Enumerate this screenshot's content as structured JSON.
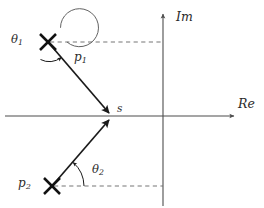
{
  "figure": {
    "background_color": "#ffffff",
    "axis_color": "#4d4d4d",
    "vector_color": "#1a1a1a",
    "dashed_color": "#6e6e6e",
    "arc_color": "#5a5a5a",
    "label_color": "#2b2b2b"
  },
  "axes": {
    "real": {
      "label": "Re",
      "label_x": 238,
      "label_y": 98,
      "x_start": 5,
      "x_end": 237,
      "y": 116
    },
    "imag": {
      "label": "Im",
      "label_x": 176,
      "label_y": 11,
      "x": 163,
      "y_top": 11,
      "y_bottom": 206
    },
    "origin": {
      "x": 163,
      "y": 116
    }
  },
  "poles": [
    {
      "name": "pole-p1",
      "label": "p",
      "subscript": "1",
      "marker": "x",
      "x": 48,
      "y": 42,
      "label_x": 74,
      "label_y": 51
    },
    {
      "name": "pole-p2",
      "label": "p",
      "subscript": "2",
      "marker": "x",
      "x": 52,
      "y": 186,
      "label_x": 18,
      "label_y": 177
    }
  ],
  "test_point": {
    "name": "test-point-s",
    "label": "s",
    "x": 112,
    "y": 116,
    "label_x": 117,
    "label_y": 103
  },
  "vectors": [
    {
      "name": "vector-p1-to-s",
      "from": {
        "x": 48,
        "y": 42
      },
      "to": {
        "x": 112,
        "y": 116
      }
    },
    {
      "name": "vector-p2-to-s",
      "from": {
        "x": 52,
        "y": 186
      },
      "to": {
        "x": 112,
        "y": 116
      }
    }
  ],
  "dashed_guides": [
    {
      "name": "dashed-guide-p1",
      "x_start": 50,
      "x_end": 163,
      "y": 42
    },
    {
      "name": "dashed-guide-p2",
      "x_start": 54,
      "x_end": 163,
      "y": 186
    }
  ],
  "angles": [
    {
      "name": "angle-theta1",
      "label": "θ",
      "subscript": "1",
      "label_x": 11,
      "label_y": 34,
      "center": {
        "x": 48,
        "y": 42
      },
      "radius": 19,
      "start_deg": 0,
      "end_deg": 311,
      "direction": "counterclockwise"
    },
    {
      "name": "angle-theta2",
      "label": "θ",
      "subscript": "2",
      "label_x": 92,
      "label_y": 164,
      "center": {
        "x": 52,
        "y": 186
      },
      "radius": 32,
      "start_deg": 0,
      "end_deg": 49,
      "direction": "counterclockwise"
    }
  ]
}
